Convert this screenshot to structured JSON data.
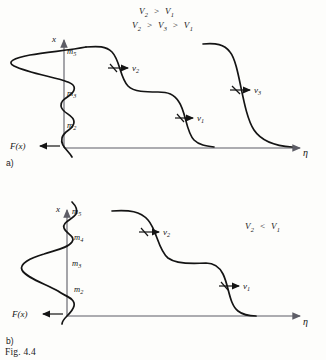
{
  "figure": {
    "caption": "Fig. 4.4",
    "panels": [
      {
        "tag": "a)",
        "axis_vertical_label": "x",
        "axis_horizontal_label": "η",
        "distribution_label": "F(x)",
        "mass_labels": [
          "m",
          "m",
          "m"
        ],
        "mass_subscripts": [
          "5",
          "3",
          "2"
        ],
        "velocity_labels": [
          "v",
          "v",
          "v"
        ],
        "velocity_subscripts": [
          "2",
          "1",
          "3"
        ],
        "inequalities": [
          {
            "v_a": "V",
            "sub_a": "2",
            "op_1": ">",
            "v_b": "V",
            "sub_b": "1"
          },
          {
            "v_a": "V",
            "sub_a": "2",
            "op_1": ">",
            "v_b": "V",
            "sub_b": "3",
            "op_2": ">",
            "v_c": "V",
            "sub_c": "1"
          }
        ]
      },
      {
        "tag": "b)",
        "axis_vertical_label": "x",
        "axis_horizontal_label": "η",
        "distribution_label": "F(x)",
        "mass_labels": [
          "m",
          "m",
          "m",
          "m"
        ],
        "mass_subscripts": [
          "5",
          "4",
          "3",
          "2"
        ],
        "velocity_labels": [
          "v",
          "v"
        ],
        "velocity_subscripts": [
          "2",
          "1"
        ],
        "inequalities": [
          {
            "v_a": "V",
            "sub_a": "2",
            "op_1": "<",
            "v_b": "V",
            "sub_b": "1"
          }
        ]
      }
    ]
  },
  "colors": {
    "ink": "#141414",
    "axis": "#5d5d66",
    "paper": "#fdfdfb"
  }
}
